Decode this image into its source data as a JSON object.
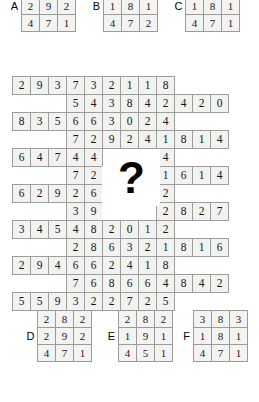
{
  "puzzle": {
    "type": "matrix-reasoning-grid",
    "question_mark": "?",
    "main_grid": {
      "columns": 12,
      "rows": 13,
      "cell_size": 19,
      "blank_region": {
        "row_start": 5,
        "row_end": 7,
        "col_start": 6,
        "col_end": 8
      },
      "rows_data": [
        {
          "index": 1,
          "col_start": 1,
          "values": [
            2,
            9,
            3,
            7,
            3,
            2,
            1,
            1,
            8
          ]
        },
        {
          "index": 2,
          "col_start": 4,
          "values": [
            5,
            4,
            3,
            8,
            4,
            2,
            4,
            2,
            0
          ]
        },
        {
          "index": 3,
          "col_start": 1,
          "values": [
            8,
            3,
            5,
            6,
            6,
            3,
            0,
            2,
            4
          ]
        },
        {
          "index": 4,
          "col_start": 4,
          "values": [
            7,
            2,
            9,
            2,
            4,
            1,
            8,
            1,
            4
          ]
        },
        {
          "index": 5,
          "col_start": 1,
          "values": [
            6,
            4,
            7,
            4,
            4,
            2,
            8,
            2,
            4
          ]
        },
        {
          "index": 6,
          "col_start": 4,
          "values": [
            7,
            2,
            null,
            null,
            null,
            1,
            6,
            1,
            4
          ]
        },
        {
          "index": 7,
          "col_start": 1,
          "values": [
            6,
            2,
            9,
            2,
            6,
            null,
            null,
            null,
            2
          ]
        },
        {
          "index": 8,
          "col_start": 4,
          "values": [
            3,
            9,
            null,
            null,
            null,
            2,
            8,
            2,
            7
          ]
        },
        {
          "index": 9,
          "col_start": 1,
          "values": [
            3,
            4,
            5,
            4,
            8,
            2,
            0,
            1,
            2
          ]
        },
        {
          "index": 10,
          "col_start": 4,
          "values": [
            2,
            8,
            6,
            3,
            2,
            1,
            8,
            1,
            6
          ]
        },
        {
          "index": 11,
          "col_start": 1,
          "values": [
            2,
            9,
            4,
            6,
            6,
            2,
            4,
            1,
            8
          ]
        },
        {
          "index": 12,
          "col_start": 4,
          "values": [
            7,
            6,
            8,
            6,
            6,
            4,
            8,
            4,
            2
          ]
        },
        {
          "index": 13,
          "col_start": 1,
          "values": [
            5,
            5,
            9,
            3,
            2,
            2,
            7,
            2,
            5
          ]
        }
      ]
    },
    "options_top": [
      {
        "label": "A",
        "rows": [
          [
            8,
            8,
            2
          ],
          [
            2,
            9,
            2
          ],
          [
            4,
            7,
            1
          ]
        ]
      },
      {
        "label": "B",
        "rows": [
          [
            2,
            8,
            2
          ],
          [
            1,
            8,
            1
          ],
          [
            4,
            7,
            2
          ]
        ]
      },
      {
        "label": "C",
        "rows": [
          [
            2,
            8,
            2
          ],
          [
            1,
            8,
            1
          ],
          [
            4,
            7,
            1
          ]
        ]
      }
    ],
    "options_bottom": [
      {
        "label": "D",
        "rows": [
          [
            2,
            8,
            2
          ],
          [
            2,
            9,
            2
          ],
          [
            4,
            7,
            1
          ]
        ]
      },
      {
        "label": "E",
        "rows": [
          [
            2,
            8,
            2
          ],
          [
            1,
            9,
            1
          ],
          [
            4,
            5,
            1
          ]
        ]
      },
      {
        "label": "F",
        "rows": [
          [
            3,
            8,
            3
          ],
          [
            1,
            8,
            1
          ],
          [
            4,
            7,
            1
          ]
        ]
      }
    ],
    "colors": {
      "cell_fill": "#f2f2f0",
      "cell_border": "#9d9d9d",
      "row_outline": "#6f6f6f",
      "text": "#151515",
      "background": "#ffffff"
    }
  }
}
